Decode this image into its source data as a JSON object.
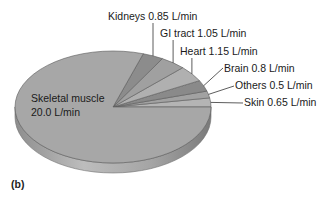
{
  "chart_data": {
    "type": "pie",
    "style": "3d-tilted",
    "title": "",
    "panel_label": "(b)",
    "unit": "L/min",
    "total": 25.0,
    "slices": [
      {
        "name": "Skin",
        "value": 0.65,
        "label": "Skin 0.65 L/min",
        "color": "#b4b4b4"
      },
      {
        "name": "Others",
        "value": 0.5,
        "label": "Others 0.5 L/min",
        "color": "#a2a2a2"
      },
      {
        "name": "Brain",
        "value": 0.8,
        "label": "Brain 0.8 L/min",
        "color": "#8a8a8a"
      },
      {
        "name": "Heart",
        "value": 1.15,
        "label": "Heart 1.15 L/min",
        "color": "#b0b0b0"
      },
      {
        "name": "GI tract",
        "value": 1.05,
        "label": "GI tract 1.05 L/min",
        "color": "#a0a0a0"
      },
      {
        "name": "Kidneys",
        "value": 0.85,
        "label": "Kidneys 0.85 L/min",
        "color": "#8c8c8c"
      },
      {
        "name": "Skeletal muscle",
        "value": 20.0,
        "label_line1": "Skeletal muscle",
        "label_line2": "20.0 L/min",
        "color": "#a7a7a7"
      }
    ],
    "categories": [
      "Skin",
      "Others",
      "Brain",
      "Heart",
      "GI tract",
      "Kidneys",
      "Skeletal muscle"
    ],
    "values": [
      0.65,
      0.5,
      0.8,
      1.15,
      1.05,
      0.85,
      20.0
    ],
    "legend": "none (direct labels with leader lines)"
  }
}
